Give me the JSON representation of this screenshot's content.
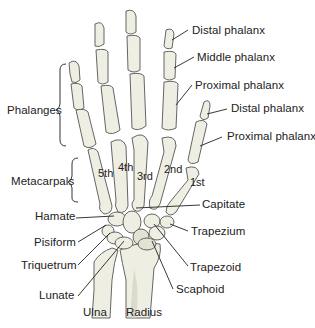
{
  "figure": {
    "group_labels": {
      "phalanges": "Phalanges",
      "metacarpals": "Metacarpals"
    },
    "finger_labels": {
      "distal_phalanx": "Distal phalanx",
      "middle_phalanx": "Middle phalanx",
      "proximal_phalanx": "Proximal phalanx"
    },
    "thumb_labels": {
      "distal_phalanx": "Distal phalanx",
      "proximal_phalanx": "Proximal phalanx"
    },
    "metacarpal_numbers": [
      "5th",
      "4th",
      "3rd",
      "2nd",
      "1st"
    ],
    "carpal_labels_left": [
      "Hamate",
      "Pisiform",
      "Triquetrum",
      "Lunate"
    ],
    "carpal_labels_right": [
      "Capitate",
      "Trapezium",
      "Trapezoid",
      "Scaphoid"
    ],
    "forearm_labels": [
      "Ulna",
      "Radius"
    ]
  }
}
